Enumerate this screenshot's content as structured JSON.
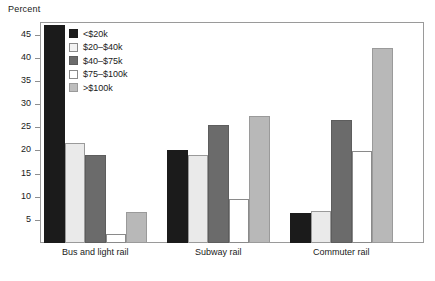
{
  "chart_data": {
    "type": "bar",
    "title": "",
    "ylabel": "Percent",
    "xlabel": "",
    "ylim": [
      0,
      47.5
    ],
    "yticks": [
      5,
      10,
      15,
      20,
      25,
      30,
      35,
      40,
      45
    ],
    "grid": false,
    "legend_position": "top-left inside plot",
    "categories": [
      "Bus and light rail",
      "Subway rail",
      "Commuter rail"
    ],
    "series": [
      {
        "name": "<$20k",
        "color": "#1b1b1b",
        "values": [
          47,
          20,
          6.5
        ]
      },
      {
        "name": "$20–$40k",
        "color": "#eaeaea",
        "values": [
          21.5,
          19,
          7
        ]
      },
      {
        "name": "$40–$75k",
        "color": "#6b6b6b",
        "values": [
          19,
          25.5,
          26.5
        ]
      },
      {
        "name": "$75–$100k",
        "color": "#ffffff",
        "values": [
          2,
          9.5,
          19.8
        ]
      },
      {
        "name": ">$100k",
        "color": "#b8b8b8",
        "values": [
          6.8,
          27.5,
          42
        ]
      }
    ]
  },
  "legend": {
    "items": [
      {
        "label": "<$20k"
      },
      {
        "label": "$20–$40k"
      },
      {
        "label": "$40–$75k"
      },
      {
        "label": "$75–$100k"
      },
      {
        "label": ">$100k"
      }
    ]
  }
}
